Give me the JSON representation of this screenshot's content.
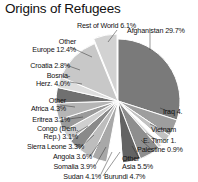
{
  "chart_data": {
    "type": "pie",
    "title": "Origins of Refugees",
    "xlabel": "",
    "ylabel": "",
    "legend_position": "none",
    "grid": false,
    "categories": [
      "Afghanistan",
      "Iraq",
      "Vietnam",
      "E. Timor",
      "Palestine",
      "Other Asia",
      "Burundi",
      "Sudan",
      "Somalia",
      "Angola",
      "Sierra Leone",
      "Congo (Dem. Rep.)",
      "Eritrea",
      "Other Africa",
      "Bosnia-Herz.",
      "Croatia",
      "Other Europe",
      "Rest of World"
    ],
    "values": [
      29.7,
      4.4,
      2.0,
      1.2,
      0.9,
      5.5,
      4.7,
      4.1,
      3.9,
      3.6,
      3.3,
      3.1,
      3.1,
      4.3,
      4.0,
      2.8,
      12.4,
      6.1
    ],
    "value_unit": "%",
    "exploded": [
      "Rest of World"
    ],
    "slice_colors": [
      "#7a7a7a",
      "#9e9e9e",
      "#c2c2c2",
      "#ffffff",
      "#d6d6d6",
      "#8e8e8e",
      "#636363",
      "#ffffff",
      "#a8a8a8",
      "#bdbdbd",
      "#8a8a8a",
      "#cfcfcf",
      "#9a9a9a",
      "#b5b5b5",
      "#707070",
      "#dedede",
      "#c8c8c8",
      "#d2d2d2"
    ]
  },
  "labels": [
    {
      "name": "rest-of-world",
      "text": "Rest of World 6.1%"
    },
    {
      "name": "other-europe",
      "line1": "Other",
      "line2": "Europe 12.4%"
    },
    {
      "name": "croatia",
      "text": "Croatia 2.8%"
    },
    {
      "name": "bosnia",
      "line1": "Bosnia-",
      "line2": "Herz. 4.0%"
    },
    {
      "name": "other-africa",
      "line1": "Other",
      "line2": "Africa 4.3%"
    },
    {
      "name": "eritrea",
      "text": "Eritrea 3.1%"
    },
    {
      "name": "congo",
      "line1": "Congo (Dem.",
      "line2": "Rep.) 3.1%"
    },
    {
      "name": "sierra-leone",
      "text": "Sierra Leone 3.3%"
    },
    {
      "name": "angola",
      "text": "Angola 3.6%"
    },
    {
      "name": "somalia",
      "text": "Somalia 3.9%"
    },
    {
      "name": "sudan",
      "text": "Sudan 4.1%"
    },
    {
      "name": "burundi",
      "text": "Burundi 4.7%"
    },
    {
      "name": "other-asia",
      "line1": "Other",
      "line2": "Asia 5.5%"
    },
    {
      "name": "palestine",
      "text": "Palestine 0.9%"
    },
    {
      "name": "e-timor",
      "text": "E. Timor 1."
    },
    {
      "name": "vietnam",
      "text": "Vietnam"
    },
    {
      "name": "iraq",
      "text": "Iraq 4."
    },
    {
      "name": "afghanistan",
      "text": "Afghanistan 29.7%"
    }
  ]
}
